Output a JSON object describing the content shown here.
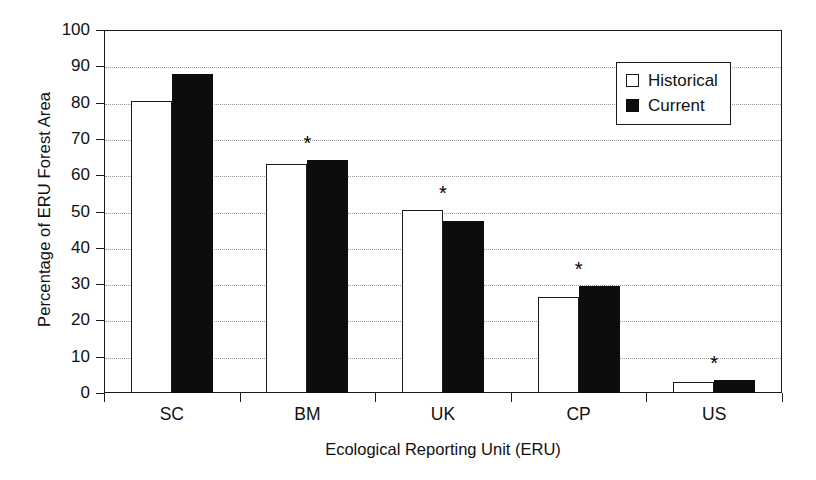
{
  "chart_data": {
    "type": "bar",
    "title": "",
    "xlabel": "Ecological Reporting Unit (ERU)",
    "ylabel": "Percentage of ERU Forest Area",
    "categories": [
      "SC",
      "BM",
      "UK",
      "CP",
      "US"
    ],
    "series": [
      {
        "name": "Historical",
        "values": [
          80.5,
          63.0,
          50.5,
          26.5,
          3.0
        ],
        "fill": "#ffffff",
        "edge": "#1a1a1a"
      },
      {
        "name": "Current",
        "values": [
          88.0,
          64.2,
          47.5,
          29.5,
          3.5
        ],
        "fill": "#0d0d0d",
        "edge": "#0d0d0d"
      }
    ],
    "ylim": [
      0,
      100
    ],
    "yticks": [
      0,
      10,
      20,
      30,
      40,
      50,
      60,
      70,
      80,
      90,
      100
    ],
    "ytick_labels": [
      "0",
      "10",
      "20",
      "30",
      "40",
      "50",
      "60",
      "70",
      "80",
      "90",
      "100"
    ],
    "grid": true,
    "grid_axis": "y",
    "grid_style": "dotted",
    "legend_position": "upper right",
    "annotations": [
      {
        "label": "*",
        "category": "BM",
        "meaning": "significant-difference-marker"
      },
      {
        "label": "*",
        "category": "UK",
        "meaning": "significant-difference-marker"
      },
      {
        "label": "*",
        "category": "CP",
        "meaning": "significant-difference-marker"
      },
      {
        "label": "*",
        "category": "US",
        "meaning": "significant-difference-marker"
      }
    ]
  },
  "legend": {
    "items": [
      {
        "label": "Historical",
        "swatch": "open-square-icon"
      },
      {
        "label": "Current",
        "swatch": "filled-square-icon"
      }
    ]
  }
}
